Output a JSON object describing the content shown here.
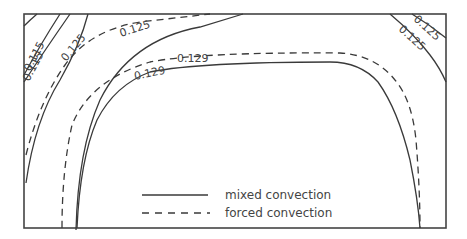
{
  "diagram": {
    "title": "",
    "contour_labels": {
      "left_a": "0.115",
      "left_b": "0.115",
      "left_mid": "0.125",
      "top_left_solid": "0.125",
      "top_center_dashed": "0.129",
      "inner_solid": "0.129",
      "right_a": "0.125",
      "right_b": "0.125"
    },
    "legend": {
      "items": [
        {
          "label": "mixed convection",
          "style": "solid"
        },
        {
          "label": "forced convection",
          "style": "dashed"
        }
      ]
    },
    "colors": {
      "line": "#3a3a3a",
      "frame": "#444444",
      "background": "#ffffff"
    }
  }
}
